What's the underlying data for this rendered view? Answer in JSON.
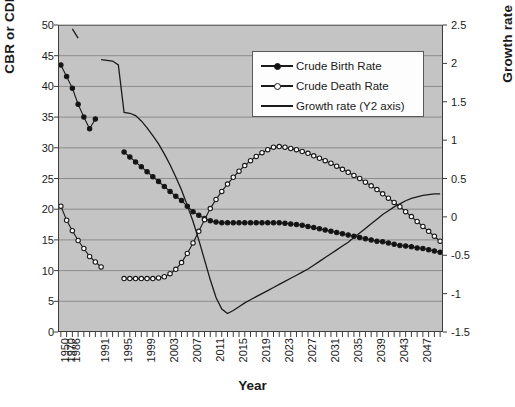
{
  "chart_data": {
    "type": "line",
    "title": "",
    "xlabel": "Year",
    "ylabel": "CBR or CDR",
    "y2label": "Growth rate (%)",
    "ylim": [
      0,
      50
    ],
    "yticks": [
      0,
      5,
      10,
      15,
      20,
      25,
      30,
      35,
      40,
      45,
      50
    ],
    "y2lim": [
      -1.5,
      2.5
    ],
    "y2ticks": [
      -1.5,
      -1,
      -0.5,
      0,
      0.5,
      1,
      1.5,
      2,
      2.5
    ],
    "ytick_labels": [
      "0",
      "5",
      "10",
      "15",
      "20",
      "25",
      "30",
      "35",
      "40",
      "45",
      "50"
    ],
    "y2tick_labels": [
      "-1.5",
      "-1",
      "-0.5",
      "0",
      "0.5",
      "1",
      "1.5",
      "2",
      "2.5"
    ],
    "grid": true,
    "legend_position": "top-right",
    "plot_background": "#c4c4c4",
    "x_categories": [
      "1950",
      "1970",
      "1986",
      "1987",
      "1988",
      "1989",
      "1990",
      "1991",
      "1992",
      "1993",
      "1994",
      "1995",
      "1996",
      "1997",
      "1998",
      "1999",
      "2000",
      "2001",
      "2002",
      "2003",
      "2004",
      "2005",
      "2006",
      "2007",
      "2008",
      "2009",
      "2010",
      "2011",
      "2012",
      "2013",
      "2014",
      "2015",
      "2016",
      "2017",
      "2018",
      "2019",
      "2020",
      "2021",
      "2022",
      "2023",
      "2024",
      "2025",
      "2026",
      "2027",
      "2028",
      "2029",
      "2030",
      "2031",
      "2032",
      "2033",
      "2034",
      "2035",
      "2036",
      "2037",
      "2038",
      "2039",
      "2040",
      "2041",
      "2042",
      "2043",
      "2044",
      "2045",
      "2046",
      "2047",
      "2048",
      "2049",
      "2050"
    ],
    "x_tick_labels_shown": [
      "1950",
      "1970",
      "1986",
      "1991",
      "1995",
      "1999",
      "2003",
      "2007",
      "2011",
      "2015",
      "2019",
      "2023",
      "2027",
      "2031",
      "2035",
      "2039",
      "2043",
      "2047"
    ],
    "series": [
      {
        "name": "Crude Birth Rate",
        "axis": "y1",
        "marker": "filled-circle",
        "values": [
          43.5,
          41.6,
          39.7,
          37.1,
          35.0,
          33.1,
          34.7,
          null,
          null,
          null,
          null,
          29.3,
          28.5,
          27.7,
          26.9,
          26.1,
          25.3,
          24.5,
          23.7,
          22.9,
          22.1,
          21.4,
          20.5,
          19.6,
          19.0,
          18.5,
          18.1,
          17.9,
          17.8,
          17.8,
          17.8,
          17.8,
          17.8,
          17.8,
          17.8,
          17.8,
          17.8,
          17.8,
          17.8,
          17.7,
          17.6,
          17.5,
          17.4,
          17.2,
          17.0,
          16.8,
          16.6,
          16.4,
          16.2,
          16.0,
          15.8,
          15.6,
          15.4,
          15.2,
          15.0,
          14.8,
          14.7,
          14.5,
          14.3,
          14.1,
          14.0,
          13.9,
          13.7,
          13.6,
          13.4,
          13.2,
          13.0
        ]
      },
      {
        "name": "Crude Death Rate",
        "axis": "y1",
        "marker": "open-circle",
        "values": [
          20.5,
          18.2,
          16.5,
          14.9,
          13.6,
          12.3,
          11.4,
          10.6,
          null,
          null,
          null,
          8.7,
          8.7,
          8.7,
          8.7,
          8.7,
          8.7,
          8.8,
          9.0,
          9.5,
          10.2,
          11.3,
          12.8,
          14.5,
          16.4,
          18.3,
          20.1,
          21.6,
          22.9,
          24.1,
          25.2,
          26.2,
          27.1,
          27.9,
          28.6,
          29.2,
          29.7,
          30.1,
          30.2,
          30.1,
          29.9,
          29.7,
          29.4,
          29.1,
          28.7,
          28.3,
          27.9,
          27.5,
          27.0,
          26.5,
          26.0,
          25.5,
          25.0,
          24.4,
          23.8,
          23.2,
          22.5,
          21.8,
          21.1,
          20.4,
          19.6,
          18.8,
          18.0,
          17.2,
          16.4,
          15.6,
          14.8
        ]
      },
      {
        "name": "Growth rate (Y2 axis)",
        "axis": "y2",
        "marker": "none",
        "segments": [
          {
            "x_index_start": 2,
            "values": [
              2.45,
              2.33
            ]
          },
          {
            "x_index_start": 7,
            "values": [
              2.05,
              2.04,
              2.03,
              1.98,
              1.36,
              1.35,
              1.32,
              1.25,
              1.16,
              1.06,
              0.95,
              0.82,
              0.68,
              0.52,
              0.35,
              0.15,
              -0.06,
              -0.3,
              -0.56,
              -0.82,
              -1.05,
              -1.2,
              -1.26,
              -1.22,
              -1.17,
              -1.12,
              -1.08,
              -1.04,
              -1.0,
              -0.96,
              -0.92,
              -0.88,
              -0.84,
              -0.8,
              -0.76,
              -0.72,
              -0.68,
              -0.63,
              -0.58,
              -0.53,
              -0.48,
              -0.43,
              -0.38,
              -0.33,
              -0.27,
              -0.21,
              -0.15,
              -0.09,
              -0.03,
              0.03,
              0.08,
              0.13,
              0.17,
              0.21,
              0.24,
              0.26,
              0.28,
              0.29,
              0.3,
              0.3
            ]
          }
        ]
      }
    ],
    "annotations": {
      "cbr_cdr_first_crossing": {
        "year": "2002",
        "value": 20.5
      },
      "cdr_peak": {
        "year": "2022",
        "value": 30.2
      },
      "growth_rate_trough": {
        "year": "2012",
        "value": -1.26
      },
      "cbr_cdr_second_crossing": {
        "year": "2039",
        "value": 14.8
      }
    }
  },
  "legend": {
    "items": [
      {
        "label": "Crude Birth Rate",
        "marker": "filled-circle"
      },
      {
        "label": "Crude Death Rate",
        "marker": "open-circle"
      },
      {
        "label": "Growth rate (Y2 axis)",
        "marker": "none"
      }
    ]
  }
}
